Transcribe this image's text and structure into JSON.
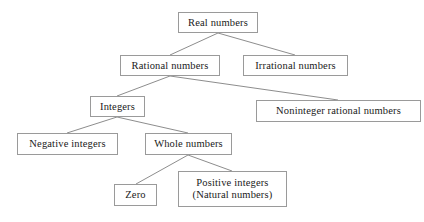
{
  "diagram": {
    "type": "hierarchy-tree",
    "background_color": "#ffffff",
    "box_border_color": "#9a9a9a",
    "connector_color": "#8d8d8d",
    "text_color": "#1a1a1a",
    "nodes": {
      "real_numbers": {
        "label": "Real numbers"
      },
      "rational_numbers": {
        "label": "Rational numbers"
      },
      "irrational_numbers": {
        "label": "Irrational numbers"
      },
      "integers": {
        "label": "Integers"
      },
      "noninteger_rational_numbers": {
        "label": "Noninteger rational numbers"
      },
      "negative_integers": {
        "label": "Negative integers"
      },
      "whole_numbers": {
        "label": "Whole numbers"
      },
      "zero": {
        "label": "Zero"
      },
      "positive_integers": {
        "label_line1": "Positive integers",
        "label_line2": "(Natural numbers)"
      }
    },
    "edges": [
      {
        "from": "real_numbers",
        "to": "rational_numbers"
      },
      {
        "from": "real_numbers",
        "to": "irrational_numbers"
      },
      {
        "from": "rational_numbers",
        "to": "integers"
      },
      {
        "from": "rational_numbers",
        "to": "noninteger_rational_numbers"
      },
      {
        "from": "integers",
        "to": "negative_integers"
      },
      {
        "from": "integers",
        "to": "whole_numbers"
      },
      {
        "from": "whole_numbers",
        "to": "zero"
      },
      {
        "from": "whole_numbers",
        "to": "positive_integers"
      }
    ]
  }
}
